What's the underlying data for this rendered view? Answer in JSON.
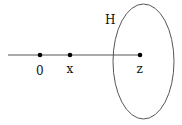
{
  "diagram": {
    "set_label": "H",
    "points": [
      {
        "id": "origin",
        "label": "0",
        "x": 40,
        "y": 55
      },
      {
        "id": "x",
        "label": "x",
        "x": 70,
        "y": 55
      },
      {
        "id": "z",
        "label": "z",
        "x": 140,
        "y": 55
      }
    ],
    "line": {
      "x1": 8,
      "x2": 140,
      "y": 55
    },
    "ellipse": {
      "cx": 143.5,
      "cy": 61.5,
      "rx": 30.5,
      "ry": 57.5
    },
    "colors": {
      "stroke": "#555555",
      "point": "#000000",
      "text": "#111111"
    }
  }
}
